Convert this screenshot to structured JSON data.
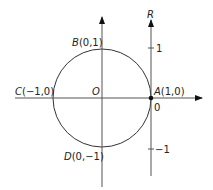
{
  "diagram": {
    "title": "",
    "colors": {
      "stroke": "#333333",
      "axis": "#555555",
      "text": "#222222",
      "point": "#111111"
    },
    "points": {
      "A": {
        "letter": "A",
        "coords": "(1,0)"
      },
      "B": {
        "letter": "B",
        "coords": "(0,1)"
      },
      "C": {
        "letter": "C",
        "coords": "(−1,0)"
      },
      "D": {
        "letter": "D",
        "coords": "(0,−1)"
      },
      "O": {
        "letter": "O"
      }
    },
    "r_axis": {
      "label": "R",
      "ticks": [
        {
          "value": "1"
        },
        {
          "value": "0"
        },
        {
          "value": "−1"
        }
      ]
    },
    "circle": {
      "description": "unit circle centered at O"
    }
  }
}
